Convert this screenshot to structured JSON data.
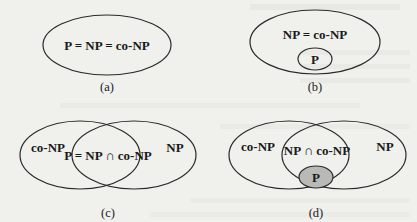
{
  "figure": {
    "background_color": "#f0f0ed",
    "stroke_color": "#2a2a2a",
    "shade_color": "#b9b9b6"
  },
  "panels": [
    {
      "id": "a",
      "caption": "(a)",
      "labels": {
        "main": "P = NP = co-NP"
      }
    },
    {
      "id": "b",
      "caption": "(b)",
      "labels": {
        "outer": "NP = co-NP",
        "inner": "P"
      }
    },
    {
      "id": "c",
      "caption": "(c)",
      "labels": {
        "left": "co-NP",
        "intersection": "P = NP ∩ co-NP",
        "right": "NP"
      }
    },
    {
      "id": "d",
      "caption": "(d)",
      "labels": {
        "left": "co-NP",
        "intersection": "NP ∩ co-NP",
        "right": "NP",
        "inner": "P"
      }
    }
  ]
}
